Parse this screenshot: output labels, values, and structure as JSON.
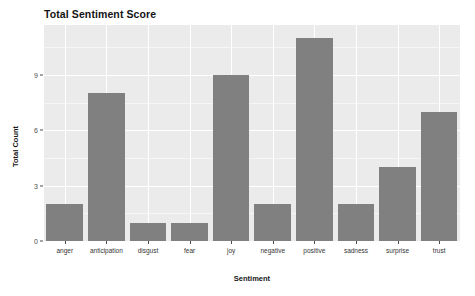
{
  "chart_data": {
    "type": "bar",
    "title": "Total Sentiment Score",
    "xlabel": "Sentiment",
    "ylabel": "Total Count",
    "categories": [
      "anger",
      "anticipation",
      "disgust",
      "fear",
      "joy",
      "negative",
      "positive",
      "sadness",
      "surprise",
      "trust"
    ],
    "values": [
      2,
      8,
      1,
      1,
      9,
      2,
      11,
      2,
      4,
      7
    ],
    "ylim": [
      0,
      11.7
    ],
    "ytick_labels": [
      "0",
      "3",
      "6",
      "9"
    ],
    "ytick_values": [
      0,
      3,
      6,
      9
    ],
    "grid": true,
    "legend": "none",
    "bar_color": "#808080",
    "panel_color": "#ebebeb",
    "grid_color": "#ffffff",
    "background_color": "#ffffff",
    "text_color": "#141414"
  }
}
